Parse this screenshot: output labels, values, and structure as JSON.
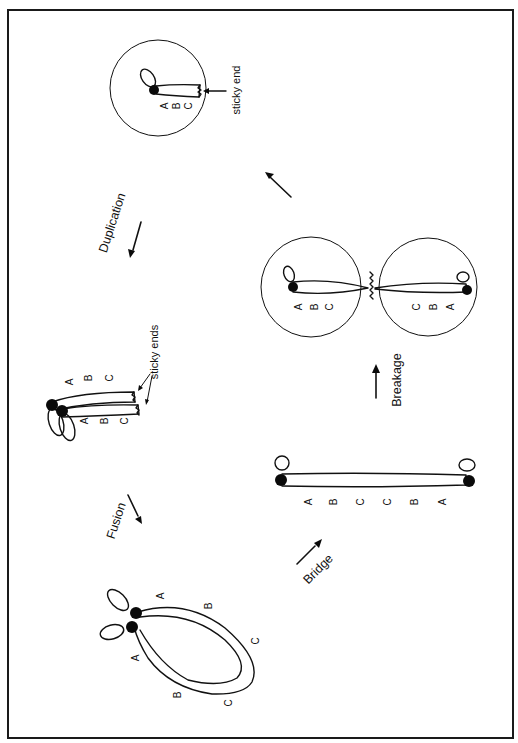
{
  "figure": {
    "orientation": "rotated 90 degrees counter-clockwise",
    "stages": {
      "fusion": {
        "label": "Fusion"
      },
      "bridge": {
        "label": "Bridge"
      },
      "breakage": {
        "label": "Breakage"
      },
      "duplication": {
        "label": "Duplication"
      }
    },
    "annotations": {
      "sticky_end": "sticky end",
      "sticky_ends": "sticky ends"
    },
    "gene_labels": {
      "a": "A",
      "b": "B",
      "c": "C"
    },
    "structures": {
      "single_chromatid_cell": {
        "genes": [
          "A",
          "B",
          "C"
        ],
        "annotation": "sticky end"
      },
      "daughter_cells": [
        {
          "genes": [
            "A",
            "B",
            "C"
          ]
        },
        {
          "genes": [
            "C",
            "B",
            "A"
          ]
        }
      ],
      "sister_chromatids": {
        "genes": [
          [
            "A",
            "B",
            "C"
          ],
          [
            "A",
            "B",
            "C"
          ]
        ],
        "annotation": "sticky ends"
      },
      "dicentric_bridge": {
        "genes": [
          "A",
          "B",
          "C",
          "C",
          "B",
          "A"
        ]
      },
      "fused_loop": {
        "genes": [
          [
            "A",
            "B",
            "C"
          ],
          [
            "A",
            "B",
            "C"
          ]
        ]
      }
    },
    "colors": {
      "ink": "#111111",
      "background": "#ffffff",
      "frame": "#1a1a1a"
    }
  }
}
